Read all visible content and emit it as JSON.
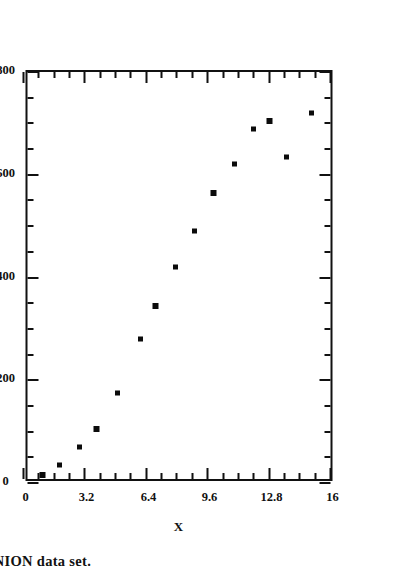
{
  "caption": "FIGURE 2  The ONION data set.",
  "chart_data": {
    "type": "scatter",
    "title": "",
    "xlabel": "X",
    "ylabel": "Y",
    "xlim": [
      0,
      16
    ],
    "ylim": [
      0,
      800
    ],
    "grid": false,
    "legend": null,
    "x_ticks": [
      "0",
      "3.2",
      "6.4",
      "9.6",
      "12.8",
      "16"
    ],
    "x_tick_values": [
      0,
      3.2,
      6.4,
      9.6,
      12.8,
      16
    ],
    "x_minor_per_interval": 3,
    "y_ticks": [
      "0",
      "200",
      "400",
      "600",
      "800"
    ],
    "y_tick_values": [
      0,
      200,
      400,
      600,
      800
    ],
    "y_minor_per_interval": 3,
    "marker": "square",
    "marker_color": "#0b0b0b",
    "points": [
      {
        "x": 1.0,
        "y": 15
      },
      {
        "x": 1.9,
        "y": 35
      },
      {
        "x": 2.9,
        "y": 70
      },
      {
        "x": 3.8,
        "y": 105
      },
      {
        "x": 4.9,
        "y": 175
      },
      {
        "x": 6.1,
        "y": 280
      },
      {
        "x": 6.9,
        "y": 345
      },
      {
        "x": 7.9,
        "y": 420
      },
      {
        "x": 8.9,
        "y": 490
      },
      {
        "x": 9.9,
        "y": 565
      },
      {
        "x": 11.0,
        "y": 620
      },
      {
        "x": 12.0,
        "y": 690
      },
      {
        "x": 12.8,
        "y": 705
      },
      {
        "x": 13.7,
        "y": 635
      },
      {
        "x": 15.0,
        "y": 720
      }
    ]
  },
  "axes": {
    "x_title": "X",
    "y_title": "Y"
  }
}
